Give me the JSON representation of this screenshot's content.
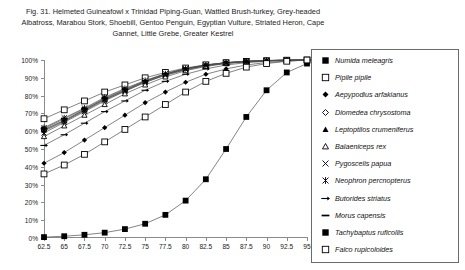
{
  "caption": {
    "line1": "Fig. 31.  Helmeted Guineafowl x Trinidad Piping-Guan, Wattled Brush-turkey, Grey-headed",
    "line2": "Albatross, Marabou Stork, Shoebill, Gentoo Penguin, Egyptian Vulture, Striated Heron, Cape",
    "line3": "Gannet, Little Grebe, Greater Kestrel"
  },
  "chart_data": {
    "type": "line",
    "xlabel": "",
    "ylabel": "",
    "x": [
      62.5,
      65,
      67.5,
      70,
      72.5,
      75,
      77.5,
      80,
      82.5,
      85,
      87.5,
      90,
      92.5,
      95
    ],
    "xlim": [
      62.5,
      95
    ],
    "ylim": [
      0,
      100
    ],
    "xtick_labels": [
      "62.5",
      "65",
      "67.5",
      "70",
      "72.5",
      "75",
      "77.5",
      "80",
      "82.5",
      "85",
      "87.5",
      "90",
      "92.5",
      "95"
    ],
    "ytick_labels": [
      "0%",
      "10%",
      "20%",
      "30%",
      "40%",
      "50%",
      "60%",
      "70%",
      "80%",
      "90%",
      "100%"
    ],
    "yticks": [
      0,
      10,
      20,
      30,
      40,
      50,
      60,
      70,
      80,
      90,
      100
    ],
    "grid": false,
    "legend_position": "right",
    "series": [
      {
        "name": "Numida meleagris",
        "marker": "filled-square",
        "values": [
          61,
          66,
          72,
          78,
          83,
          88,
          92,
          95,
          97,
          98.5,
          99.3,
          99.7,
          99.9,
          100
        ]
      },
      {
        "name": "Pipile pipile",
        "marker": "open-square",
        "values": [
          67,
          72,
          77,
          82,
          86,
          90,
          93,
          95.5,
          97.3,
          98.5,
          99.2,
          99.6,
          99.9,
          100
        ]
      },
      {
        "name": "Aepypodius arfakianus",
        "marker": "filled-diamond",
        "values": [
          42,
          48,
          55,
          62,
          69,
          76,
          82,
          87.5,
          92,
          95,
          97.2,
          98.6,
          99.4,
          100
        ]
      },
      {
        "name": "Diomedea chrysostoma",
        "marker": "open-diamond",
        "values": [
          60,
          65.5,
          71.5,
          77.5,
          82.5,
          87.5,
          91.5,
          94.5,
          96.8,
          98.2,
          99.1,
          99.6,
          99.9,
          100
        ]
      },
      {
        "name": "Leptoptilos crumeniferus",
        "marker": "filled-triangle",
        "values": [
          60.5,
          66,
          72,
          78,
          83,
          88,
          92,
          95,
          97,
          98.4,
          99.2,
          99.7,
          99.9,
          100
        ]
      },
      {
        "name": "Balaeniceps rex",
        "marker": "open-triangle",
        "values": [
          57,
          63,
          69,
          75,
          81,
          86,
          90.5,
          94,
          96.4,
          98,
          99,
          99.5,
          99.8,
          100
        ]
      },
      {
        "name": "Pygoscelis papua",
        "marker": "cross-x",
        "values": [
          59,
          65,
          71,
          77,
          82.5,
          87.5,
          91.5,
          94.6,
          96.8,
          98.2,
          99.1,
          99.6,
          99.9,
          100
        ]
      },
      {
        "name": "Neophron percnopterus",
        "marker": "star-x",
        "values": [
          62,
          67.5,
          73,
          79,
          84,
          88.5,
          92.3,
          95.2,
          97.2,
          98.5,
          99.3,
          99.7,
          99.9,
          100
        ]
      },
      {
        "name": "Butorides striatus",
        "marker": "dash-arrow",
        "values": [
          52,
          58,
          64.5,
          71,
          77,
          83,
          88,
          92,
          95,
          97.2,
          98.5,
          99.3,
          99.8,
          100
        ]
      },
      {
        "name": "Morus capensis",
        "marker": "dash",
        "values": [
          61.5,
          67,
          72.5,
          78.5,
          83.5,
          88.3,
          92.2,
          95.1,
          97.1,
          98.5,
          99.3,
          99.7,
          99.9,
          100
        ]
      },
      {
        "name": "Tachybaptus ruficollis",
        "marker": "filled-square",
        "values": [
          0.5,
          1,
          1.8,
          3,
          5,
          8,
          13,
          21,
          33,
          50,
          68,
          83,
          93,
          98
        ]
      },
      {
        "name": "Falco rupicoloides",
        "marker": "open-square",
        "values": [
          36,
          41,
          47,
          54,
          61,
          68,
          75,
          82,
          88,
          92.5,
          96,
          98,
          99.3,
          100
        ]
      }
    ]
  },
  "legend": {
    "items": [
      {
        "label": "Numida meleagris",
        "marker": "filled-square"
      },
      {
        "label": "Pipile pipile",
        "marker": "open-square"
      },
      {
        "label": "Aepypodius arfakianus",
        "marker": "filled-diamond"
      },
      {
        "label": "Diomedea chrysostoma",
        "marker": "open-diamond"
      },
      {
        "label": "Leptoptilos crumeniferus",
        "marker": "filled-triangle"
      },
      {
        "label": "Balaeniceps rex",
        "marker": "open-triangle"
      },
      {
        "label": "Pygoscelis papua",
        "marker": "cross-x"
      },
      {
        "label": "Neophron percnopterus",
        "marker": "star-x"
      },
      {
        "label": "Butorides striatus",
        "marker": "dash-arrow"
      },
      {
        "label": "Morus capensis",
        "marker": "dash"
      },
      {
        "label": "Tachybaptus ruficollis",
        "marker": "filled-square"
      },
      {
        "label": "Falco rupicoloides",
        "marker": "open-square"
      }
    ]
  },
  "style": {
    "line_color": "#4d4d4d",
    "marker_color": "#000000",
    "axis_color": "#8a8a8a",
    "text_color": "#111111",
    "background": "#ffffff"
  }
}
